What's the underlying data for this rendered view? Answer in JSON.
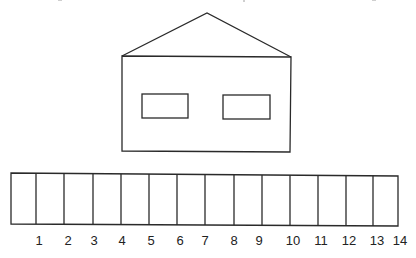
{
  "diagram": {
    "house": {
      "parts": [
        "roof",
        "wall",
        "left-window",
        "right-window"
      ]
    },
    "strip": {
      "cell_count": 14,
      "labels": [
        "1",
        "2",
        "3",
        "4",
        "5",
        "6",
        "7",
        "8",
        "9",
        "10",
        "11",
        "12",
        "13",
        "14"
      ]
    },
    "colors": {
      "line": "#2a2a2a",
      "text": "#222222",
      "background": "#ffffff"
    }
  }
}
